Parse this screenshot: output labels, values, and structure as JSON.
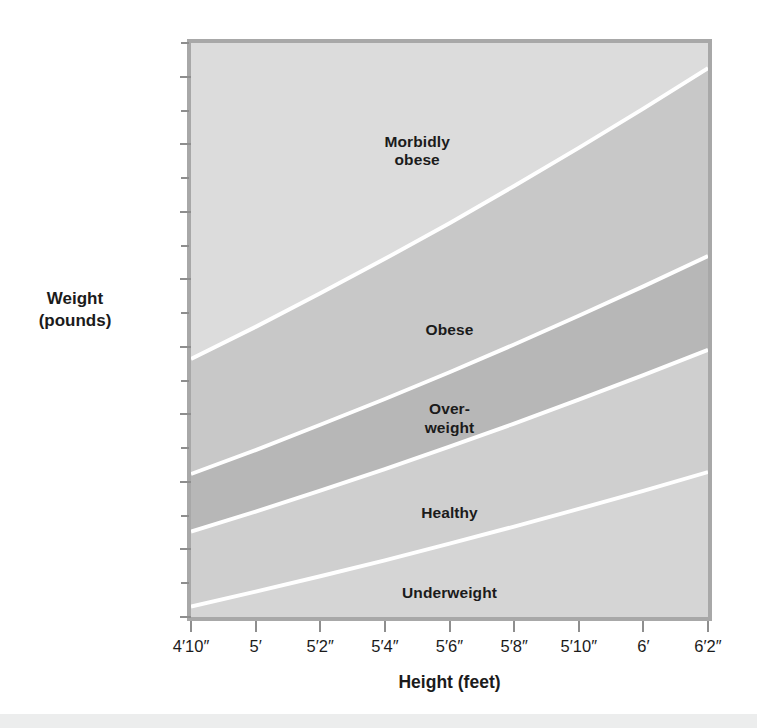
{
  "chart_data": {
    "type": "area",
    "title": "",
    "subtitle": "",
    "xlabel": "Height (feet)",
    "ylabel": "Weight\n(pounds)",
    "ylabel_lines": [
      "Weight",
      "(pounds)"
    ],
    "grid": false,
    "legend_position": "inline-band-labels",
    "x_tick_labels": [
      "4′10″",
      "5′",
      "5′2″",
      "5′4″",
      "5′6″",
      "5′8″",
      "5′10″",
      "6′",
      "6′2″"
    ],
    "x_tick_values_inches": [
      58,
      60,
      62,
      64,
      66,
      68,
      70,
      72,
      74
    ],
    "xlim_inches": [
      58,
      74
    ],
    "y_tick_labels": [
      "84",
      "112",
      "140",
      "168",
      "196",
      "224",
      "252",
      "280",
      "308"
    ],
    "y_tick_values": [
      84,
      112,
      140,
      168,
      196,
      224,
      252,
      280,
      308
    ],
    "y_minor_tick_values": [
      98,
      126,
      154,
      182,
      210,
      238,
      266,
      294,
      322
    ],
    "ylim": [
      84,
      322
    ],
    "bands": [
      {
        "name": "Underweight",
        "label": "Underweight",
        "color": "#d5d5d5",
        "bmi_range": [
          0,
          18.5
        ],
        "lower_bound_label": "bottom of chart",
        "upper_bound_label": "BMI 18.5",
        "label_x_inches": 66,
        "label_y_pounds": 94,
        "boundary_upper_weights": [
          88.3,
          94.5,
          100.9,
          107.5,
          114.4,
          121.5,
          128.8,
          136.3,
          144.1
        ]
      },
      {
        "name": "Healthy",
        "label": "Healthy",
        "color": "#cfcfcf",
        "bmi_range": [
          18.5,
          25
        ],
        "lower_bound_label": "BMI 18.5",
        "upper_bound_label": "BMI 25",
        "label_x_inches": 66,
        "label_y_pounds": 127,
        "boundary_upper_weights": [
          119.4,
          127.7,
          136.4,
          145.3,
          154.6,
          164.2,
          174.1,
          184.3,
          194.8
        ]
      },
      {
        "name": "Over-weight",
        "label": "Over-\nweight",
        "color": "#b7b7b7",
        "bmi_range": [
          25,
          30
        ],
        "lower_bound_label": "BMI 25",
        "upper_bound_label": "BMI 30",
        "label_x_inches": 66,
        "label_y_pounds": 166,
        "boundary_upper_weights": [
          143.3,
          153.2,
          163.7,
          174.4,
          185.5,
          197.0,
          208.9,
          221.1,
          233.7
        ]
      },
      {
        "name": "Obese",
        "label": "Obese",
        "color": "#c8c8c8",
        "bmi_range": [
          30,
          40
        ],
        "lower_bound_label": "BMI 30",
        "upper_bound_label": "BMI 40",
        "label_x_inches": 66,
        "label_y_pounds": 203,
        "boundary_upper_weights": [
          191.0,
          204.3,
          218.2,
          232.5,
          247.3,
          262.7,
          278.5,
          294.8,
          311.6
        ]
      },
      {
        "name": "Morbidly obese",
        "label": "Morbidly\nobese",
        "color": "#dcdcdc",
        "bmi_range": [
          40,
          100
        ],
        "lower_bound_label": "BMI 40",
        "upper_bound_label": "top of chart",
        "label_x_inches": 65,
        "label_y_pounds": 277,
        "boundary_upper_weights": [
          null,
          null,
          null,
          null,
          null,
          null,
          null,
          null,
          null
        ]
      }
    ],
    "boundary_line_color": "#ffffff",
    "plot_background": "#d9d9d9",
    "frame_color": "#a8a8a8",
    "axis_tick_color": "#8e8e8e",
    "text_color": "#1b1b1b"
  },
  "chart": {
    "band_labels": {
      "morbidly_obese": "Morbidly\nobese",
      "obese": "Obese",
      "overweight": "Over-\nweight",
      "healthy": "Healthy",
      "underweight": "Underweight"
    },
    "y_axis_title": "Weight\n(pounds)",
    "x_axis_title": "Height (feet)"
  }
}
